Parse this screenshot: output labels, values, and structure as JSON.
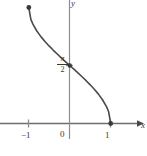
{
  "figure": {
    "title": "",
    "background_color": "#ffffff"
  },
  "labels": {
    "x_axis_name": "x",
    "y_axis_name": "y",
    "tick_neg_one": "−1",
    "tick_zero": "0",
    "tick_one": "1",
    "y_value_numerator": "π",
    "y_value_denominator": "2"
  },
  "colors": {
    "curve": "#4a4a4a",
    "axis": "#6e6e6e",
    "tick": "#8a8a8a",
    "text": "#3a3a3a",
    "point": "#3a3a3a",
    "background": "#ffffff"
  },
  "chart_data": {
    "type": "line",
    "title": "",
    "xlabel": "x",
    "ylabel": "y",
    "function": "y = arccos(x)",
    "grid": false,
    "legend": false,
    "xlim": [
      -1.45,
      1.7
    ],
    "ylim": [
      -0.45,
      3.6
    ],
    "xticks": [
      -1,
      0,
      1
    ],
    "xtick_labels": [
      "−1",
      "0",
      "1"
    ],
    "yticks": [
      1.5708
    ],
    "ytick_labels": [
      "π/2"
    ],
    "series": [
      {
        "name": "arccos(x)",
        "x": [
          -1.0,
          -0.95,
          -0.9,
          -0.8,
          -0.7,
          -0.6,
          -0.5,
          -0.4,
          -0.3,
          -0.2,
          -0.1,
          0.0,
          0.1,
          0.2,
          0.3,
          0.4,
          0.5,
          0.6,
          0.7,
          0.8,
          0.9,
          0.95,
          1.0
        ],
        "y": [
          3.1416,
          2.8198,
          2.6906,
          2.4981,
          2.3462,
          2.2143,
          2.0944,
          1.9823,
          1.8755,
          1.7722,
          1.671,
          1.5708,
          1.4706,
          1.3694,
          1.2661,
          1.1593,
          1.0472,
          0.9273,
          0.7954,
          0.6435,
          0.451,
          0.3176,
          0.0
        ]
      }
    ],
    "points": [
      {
        "name": "left-endpoint",
        "x": -1.0,
        "y": 3.1416,
        "label": ""
      },
      {
        "name": "y-intercept",
        "x": 0.0,
        "y": 1.5708,
        "label": "π/2"
      },
      {
        "name": "right-endpoint",
        "x": 1.0,
        "y": 0.0,
        "label": ""
      }
    ],
    "annotations": []
  }
}
